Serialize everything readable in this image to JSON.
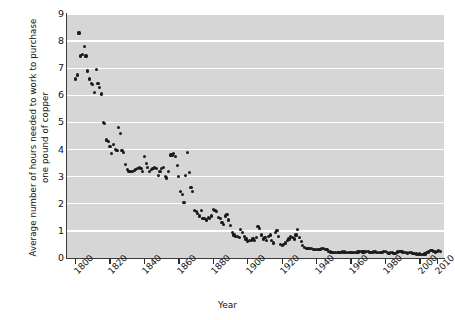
{
  "chart_data": {
    "type": "scatter",
    "title": "",
    "xlabel": "Year",
    "ylabel": "Average number of hours needed to work to purchase one pound of copper",
    "xlim": [
      1795,
      2014
    ],
    "ylim": [
      0,
      9
    ],
    "xticks": [
      1800,
      1820,
      1840,
      1860,
      1880,
      1900,
      1920,
      1940,
      1960,
      1980,
      2000,
      2010
    ],
    "yticks": [
      0,
      1,
      2,
      3,
      4,
      5,
      6,
      7,
      8,
      9
    ],
    "grid": "horizontal",
    "legend": "none",
    "marker_color": "#1a1a1a",
    "plot_background": "#d6d6d6",
    "gridline_color": "#ffffff",
    "points": [
      [
        1800,
        6.6
      ],
      [
        1801,
        6.75
      ],
      [
        1802,
        8.3
      ],
      [
        1803,
        7.45
      ],
      [
        1804,
        7.5
      ],
      [
        1805,
        7.8
      ],
      [
        1806,
        7.45
      ],
      [
        1807,
        6.9
      ],
      [
        1808,
        6.6
      ],
      [
        1809,
        6.45
      ],
      [
        1810,
        6.4
      ],
      [
        1811,
        6.1
      ],
      [
        1812,
        6.95
      ],
      [
        1813,
        6.45
      ],
      [
        1814,
        6.3
      ],
      [
        1815,
        6.05
      ],
      [
        1816,
        5.0
      ],
      [
        1817,
        4.95
      ],
      [
        1818,
        4.35
      ],
      [
        1819,
        4.3
      ],
      [
        1820,
        4.1
      ],
      [
        1821,
        3.85
      ],
      [
        1822,
        4.2
      ],
      [
        1823,
        4.0
      ],
      [
        1824,
        3.95
      ],
      [
        1825,
        4.8
      ],
      [
        1826,
        4.6
      ],
      [
        1827,
        3.95
      ],
      [
        1828,
        3.9
      ],
      [
        1829,
        3.45
      ],
      [
        1830,
        3.25
      ],
      [
        1831,
        3.2
      ],
      [
        1832,
        3.2
      ],
      [
        1833,
        3.2
      ],
      [
        1834,
        3.22
      ],
      [
        1835,
        3.25
      ],
      [
        1836,
        3.3
      ],
      [
        1837,
        3.35
      ],
      [
        1838,
        3.3
      ],
      [
        1839,
        3.2
      ],
      [
        1840,
        3.75
      ],
      [
        1841,
        3.5
      ],
      [
        1842,
        3.35
      ],
      [
        1843,
        3.2
      ],
      [
        1844,
        3.25
      ],
      [
        1845,
        3.3
      ],
      [
        1846,
        3.35
      ],
      [
        1847,
        3.3
      ],
      [
        1848,
        3.05
      ],
      [
        1849,
        3.2
      ],
      [
        1850,
        3.3
      ],
      [
        1851,
        3.35
      ],
      [
        1852,
        3.0
      ],
      [
        1853,
        2.95
      ],
      [
        1854,
        3.2
      ],
      [
        1855,
        3.8
      ],
      [
        1856,
        3.8
      ],
      [
        1857,
        3.85
      ],
      [
        1858,
        3.75
      ],
      [
        1859,
        3.4
      ],
      [
        1860,
        3.0
      ],
      [
        1861,
        2.45
      ],
      [
        1862,
        2.35
      ],
      [
        1863,
        2.05
      ],
      [
        1864,
        3.05
      ],
      [
        1865,
        3.9
      ],
      [
        1866,
        3.15
      ],
      [
        1867,
        2.6
      ],
      [
        1868,
        2.45
      ],
      [
        1869,
        1.75
      ],
      [
        1870,
        1.7
      ],
      [
        1871,
        1.65
      ],
      [
        1872,
        1.55
      ],
      [
        1873,
        1.75
      ],
      [
        1874,
        1.45
      ],
      [
        1875,
        1.45
      ],
      [
        1876,
        1.4
      ],
      [
        1877,
        1.5
      ],
      [
        1878,
        1.45
      ],
      [
        1879,
        1.55
      ],
      [
        1880,
        1.8
      ],
      [
        1881,
        1.75
      ],
      [
        1882,
        1.7
      ],
      [
        1883,
        1.5
      ],
      [
        1884,
        1.45
      ],
      [
        1885,
        1.3
      ],
      [
        1886,
        1.25
      ],
      [
        1887,
        1.55
      ],
      [
        1888,
        1.6
      ],
      [
        1889,
        1.4
      ],
      [
        1890,
        1.2
      ],
      [
        1891,
        0.95
      ],
      [
        1892,
        0.85
      ],
      [
        1893,
        0.8
      ],
      [
        1894,
        0.8
      ],
      [
        1895,
        0.75
      ],
      [
        1896,
        1.05
      ],
      [
        1897,
        0.95
      ],
      [
        1898,
        0.8
      ],
      [
        1899,
        0.7
      ],
      [
        1900,
        0.6
      ],
      [
        1901,
        0.65
      ],
      [
        1902,
        0.65
      ],
      [
        1903,
        0.7
      ],
      [
        1904,
        0.65
      ],
      [
        1905,
        0.75
      ],
      [
        1906,
        1.15
      ],
      [
        1907,
        1.1
      ],
      [
        1908,
        0.85
      ],
      [
        1909,
        0.7
      ],
      [
        1910,
        0.75
      ],
      [
        1911,
        0.65
      ],
      [
        1912,
        0.8
      ],
      [
        1913,
        0.85
      ],
      [
        1914,
        0.65
      ],
      [
        1915,
        0.55
      ],
      [
        1916,
        0.95
      ],
      [
        1917,
        1.0
      ],
      [
        1918,
        0.8
      ],
      [
        1919,
        0.5
      ],
      [
        1920,
        0.45
      ],
      [
        1921,
        0.5
      ],
      [
        1922,
        0.55
      ],
      [
        1923,
        0.65
      ],
      [
        1924,
        0.7
      ],
      [
        1925,
        0.8
      ],
      [
        1926,
        0.75
      ],
      [
        1927,
        0.7
      ],
      [
        1928,
        0.85
      ],
      [
        1929,
        1.05
      ],
      [
        1930,
        0.75
      ],
      [
        1931,
        0.6
      ],
      [
        1932,
        0.45
      ],
      [
        1933,
        0.4
      ],
      [
        1934,
        0.35
      ],
      [
        1935,
        0.35
      ],
      [
        1936,
        0.35
      ],
      [
        1937,
        0.35
      ],
      [
        1938,
        0.3
      ],
      [
        1939,
        0.3
      ],
      [
        1940,
        0.3
      ],
      [
        1941,
        0.3
      ],
      [
        1942,
        0.3
      ],
      [
        1943,
        0.35
      ],
      [
        1944,
        0.35
      ],
      [
        1945,
        0.3
      ],
      [
        1946,
        0.3
      ],
      [
        1947,
        0.25
      ],
      [
        1948,
        0.22
      ],
      [
        1949,
        0.2
      ],
      [
        1950,
        0.2
      ],
      [
        1951,
        0.2
      ],
      [
        1952,
        0.2
      ],
      [
        1953,
        0.2
      ],
      [
        1954,
        0.2
      ],
      [
        1955,
        0.22
      ],
      [
        1956,
        0.22
      ],
      [
        1957,
        0.2
      ],
      [
        1958,
        0.2
      ],
      [
        1959,
        0.2
      ],
      [
        1960,
        0.2
      ],
      [
        1961,
        0.2
      ],
      [
        1962,
        0.2
      ],
      [
        1963,
        0.2
      ],
      [
        1964,
        0.22
      ],
      [
        1965,
        0.25
      ],
      [
        1966,
        0.25
      ],
      [
        1967,
        0.22
      ],
      [
        1968,
        0.22
      ],
      [
        1969,
        0.25
      ],
      [
        1970,
        0.25
      ],
      [
        1971,
        0.2
      ],
      [
        1972,
        0.2
      ],
      [
        1973,
        0.22
      ],
      [
        1974,
        0.25
      ],
      [
        1975,
        0.2
      ],
      [
        1976,
        0.2
      ],
      [
        1977,
        0.2
      ],
      [
        1978,
        0.2
      ],
      [
        1979,
        0.25
      ],
      [
        1980,
        0.25
      ],
      [
        1981,
        0.2
      ],
      [
        1982,
        0.18
      ],
      [
        1983,
        0.2
      ],
      [
        1984,
        0.2
      ],
      [
        1985,
        0.18
      ],
      [
        1986,
        0.18
      ],
      [
        1987,
        0.22
      ],
      [
        1988,
        0.25
      ],
      [
        1989,
        0.25
      ],
      [
        1990,
        0.22
      ],
      [
        1991,
        0.2
      ],
      [
        1992,
        0.2
      ],
      [
        1993,
        0.18
      ],
      [
        1994,
        0.2
      ],
      [
        1995,
        0.2
      ],
      [
        1996,
        0.18
      ],
      [
        1997,
        0.18
      ],
      [
        1998,
        0.15
      ],
      [
        1999,
        0.13
      ],
      [
        2000,
        0.15
      ],
      [
        2001,
        0.13
      ],
      [
        2002,
        0.13
      ],
      [
        2003,
        0.15
      ],
      [
        2004,
        0.2
      ],
      [
        2005,
        0.22
      ],
      [
        2006,
        0.28
      ],
      [
        2007,
        0.28
      ],
      [
        2008,
        0.25
      ],
      [
        2009,
        0.22
      ],
      [
        2010,
        0.25
      ],
      [
        2011,
        0.27
      ],
      [
        2012,
        0.25
      ]
    ]
  }
}
